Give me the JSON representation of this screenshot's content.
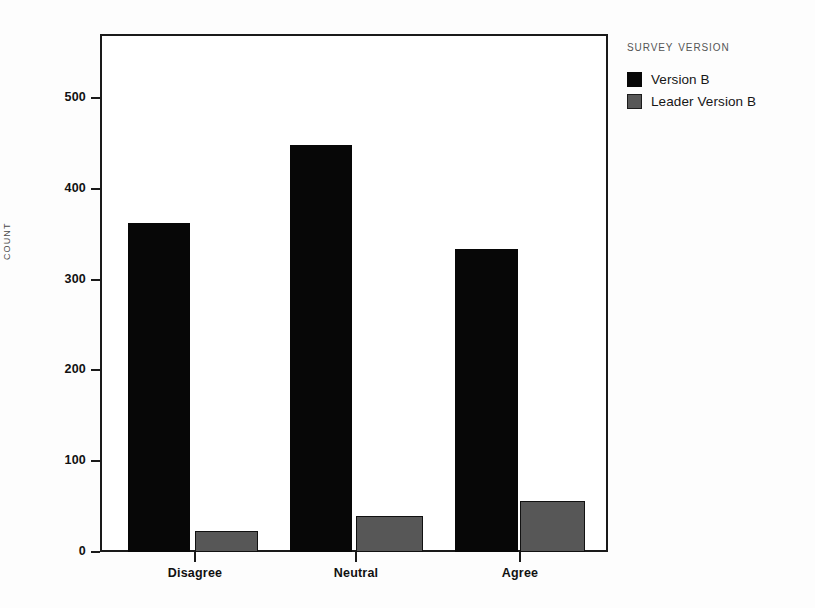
{
  "chart_data": {
    "type": "bar",
    "title": "",
    "xlabel": "",
    "ylabel": "Count",
    "categories": [
      "Disagree",
      "Neutral",
      "Agree"
    ],
    "series": [
      {
        "name": "Version B",
        "color": "#070707",
        "values": [
          362,
          448,
          334
        ]
      },
      {
        "name": "Leader Version B",
        "color": "#575757",
        "values": [
          23,
          40,
          56
        ]
      }
    ],
    "ylim": [
      0,
      560
    ],
    "yticks": [
      0,
      100,
      200,
      300,
      400,
      500
    ],
    "ytick_labels": [
      "0",
      "100",
      "200",
      "300",
      "400",
      "500"
    ],
    "grid": false,
    "legend_position": "right",
    "legend_title": "Survey Version"
  },
  "axis": {
    "y_label": "Count",
    "y_tick_labels": [
      "0",
      "100",
      "200",
      "300",
      "400",
      "500"
    ],
    "x_tick_labels": [
      "Disagree",
      "Neutral",
      "Agree"
    ]
  },
  "legend": {
    "title": "Survey Version",
    "items": [
      {
        "label": "Version B",
        "color": "#070707"
      },
      {
        "label": "Leader Version B",
        "color": "#575757"
      }
    ]
  }
}
